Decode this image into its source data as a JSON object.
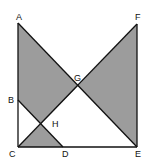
{
  "diagram": {
    "type": "geometry",
    "fill_color": "#9c9c9c",
    "stroke_color": "#111111",
    "points": {
      "A": {
        "label": "A",
        "x": 18,
        "y": 23
      },
      "B": {
        "label": "B",
        "x": 18,
        "y": 100
      },
      "C": {
        "label": "C",
        "x": 18,
        "y": 147
      },
      "D": {
        "label": "D",
        "x": 63,
        "y": 147
      },
      "E": {
        "label": "E",
        "x": 137,
        "y": 147
      },
      "F": {
        "label": "F",
        "x": 137,
        "y": 24
      },
      "G": {
        "label": "G",
        "x": 78,
        "y": 86
      },
      "H": {
        "label": "H",
        "x": 41,
        "y": 124
      }
    },
    "segments": [
      "AC",
      "CE",
      "EF",
      "AE",
      "CF",
      "BD"
    ],
    "shaded_regions": [
      "ABHG",
      "CDH",
      "GEF"
    ]
  }
}
